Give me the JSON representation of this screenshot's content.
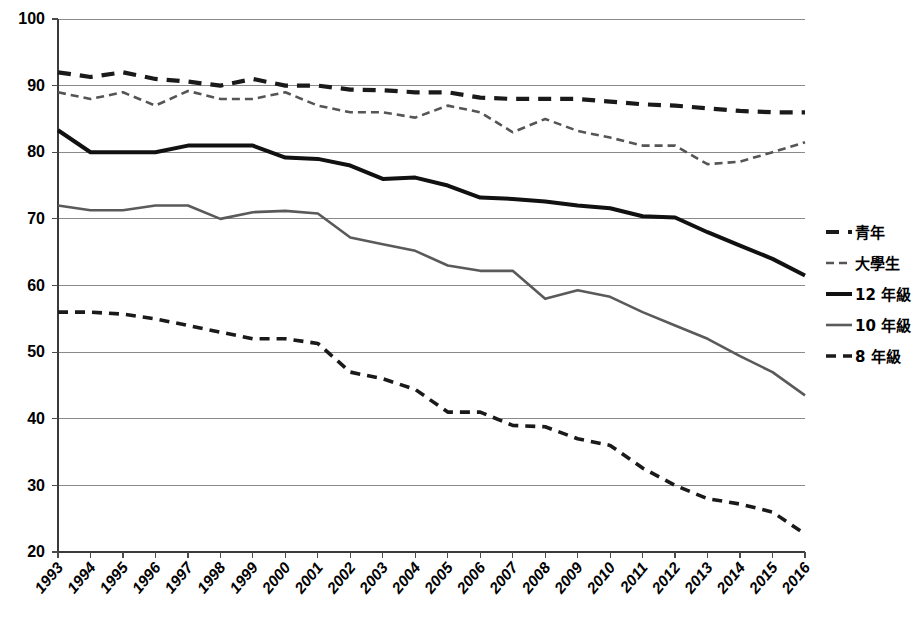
{
  "chart_data": {
    "type": "line",
    "title": "",
    "subtitle": "",
    "xlabel": "",
    "ylabel": "",
    "xlim": [
      1993,
      2016
    ],
    "ylim": [
      20,
      100
    ],
    "yticks": [
      20,
      30,
      40,
      50,
      60,
      70,
      80,
      90,
      100
    ],
    "grid": true,
    "legend_position": "right",
    "categories": [
      "1993",
      "1994",
      "1995",
      "1996",
      "1997",
      "1998",
      "1999",
      "2000",
      "2001",
      "2002",
      "2003",
      "2004",
      "2005",
      "2006",
      "2007",
      "2008",
      "2009",
      "2010",
      "2011",
      "2012",
      "2013",
      "2014",
      "2015",
      "2016"
    ],
    "series": [
      {
        "name": "青年",
        "style": "dashed-bold",
        "color": "#1a1a1a",
        "width": 4.2,
        "dash": "13,9",
        "values": [
          92.0,
          91.3,
          92.0,
          91.0,
          90.6,
          90.0,
          91.0,
          90.0,
          90.0,
          89.4,
          89.3,
          89.0,
          89.0,
          88.2,
          88.0,
          88.0,
          88.0,
          87.6,
          87.2,
          87.0,
          86.6,
          86.2,
          86.0,
          86.0
        ]
      },
      {
        "name": "大學生",
        "style": "dashed-thin",
        "color": "#555555",
        "width": 2.6,
        "dash": "8,5",
        "values": [
          89.0,
          88.0,
          89.0,
          87.0,
          89.2,
          88.0,
          88.0,
          89.0,
          87.0,
          86.0,
          86.0,
          85.2,
          87.0,
          86.0,
          83.0,
          85.0,
          83.2,
          82.2,
          81.0,
          81.0,
          78.2,
          78.6,
          80.0,
          81.5
        ]
      },
      {
        "name": "12 年級",
        "style": "solid-bold",
        "color": "#111111",
        "width": 4.0,
        "dash": "",
        "values": [
          83.3,
          80.0,
          80.0,
          80.0,
          81.0,
          81.0,
          81.0,
          79.2,
          79.0,
          78.0,
          76.0,
          76.2,
          75.0,
          73.2,
          73.0,
          72.6,
          72.0,
          71.6,
          70.4,
          70.2,
          68.0,
          66.0,
          64.0,
          61.5
        ]
      },
      {
        "name": "10 年級",
        "style": "solid-thin",
        "color": "#5a5a5a",
        "width": 2.6,
        "dash": "",
        "values": [
          72.0,
          71.3,
          71.3,
          72.0,
          72.0,
          70.0,
          71.0,
          71.2,
          70.8,
          67.2,
          66.2,
          65.2,
          63.0,
          62.2,
          62.2,
          58.0,
          59.3,
          58.3,
          56.0,
          54.0,
          52.0,
          49.4,
          47.0,
          43.5
        ]
      },
      {
        "name": "8 年級",
        "style": "dashed-bold",
        "color": "#1a1a1a",
        "width": 3.6,
        "dash": "10,7",
        "values": [
          56.0,
          56.0,
          55.7,
          55.0,
          54.0,
          53.0,
          52.0,
          52.0,
          51.3,
          47.0,
          46.0,
          44.4,
          41.0,
          41.0,
          39.0,
          38.8,
          37.0,
          36.0,
          32.6,
          30.0,
          28.0,
          27.2,
          26.0,
          22.7
        ]
      }
    ]
  },
  "legend": {
    "items": [
      {
        "label": "青年"
      },
      {
        "label": "大學生"
      },
      {
        "label": "12 年級"
      },
      {
        "label": "10 年級"
      },
      {
        "label": "8 年級"
      }
    ]
  },
  "colors": {
    "background": "#ffffff",
    "grid": "#8a8a8a",
    "axis": "#3a3a3a",
    "text": "#000000"
  }
}
